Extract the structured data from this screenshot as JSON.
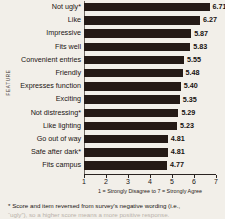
{
  "chart_data": {
    "type": "bar",
    "orientation": "horizontal",
    "title": "",
    "xlabel": "1 = Strongly Disagree to 7 = Strongly Agree",
    "ylabel": "FEATURE",
    "xlim": [
      1,
      7
    ],
    "xticks": [
      1,
      2,
      3,
      4,
      5,
      6,
      7
    ],
    "grid": false,
    "legend": false,
    "bar_color": "#241a16",
    "background_color": "#f2efe9",
    "categories": [
      "Not ugly*",
      "Like",
      "Impressive",
      "Fits well",
      "Convenient entries",
      "Friendly",
      "Expresses function",
      "Exciting",
      "Not distressing*",
      "Like lighting",
      "Go out of way",
      "Safe after dark*",
      "Fits campus"
    ],
    "values": [
      6.71,
      6.27,
      5.87,
      5.83,
      5.55,
      5.48,
      5.4,
      5.35,
      5.29,
      5.23,
      4.81,
      4.81,
      4.77
    ],
    "value_labels": [
      "6.71",
      "6.27",
      "5.87",
      "5.83",
      "5.55",
      "5.48",
      "5.40",
      "5.35",
      "5.29",
      "5.23",
      "4.81",
      "4.81",
      "4.77"
    ]
  },
  "footnote": {
    "line1": "* Score and item reversed from survey's negative wording (i.e.,",
    "line2": "“ugly”), so a higher score means a more positive response."
  }
}
